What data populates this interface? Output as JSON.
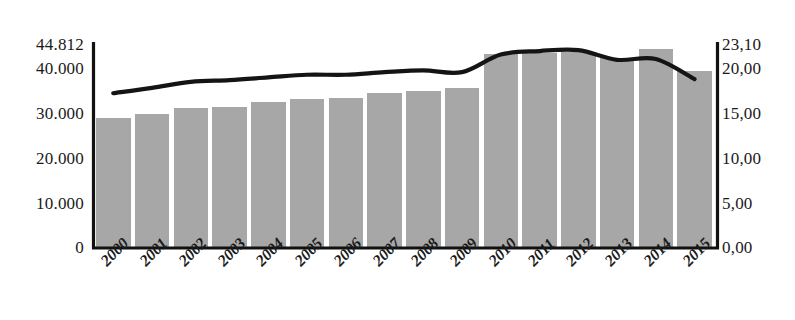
{
  "chart_data": {
    "type": "bar",
    "title": "",
    "subtitle": "",
    "xlabel": "",
    "ylabel": "",
    "grid": false,
    "legend": "none",
    "categories": [
      "2000",
      "2001",
      "2002",
      "2003",
      "2004",
      "2005",
      "2006",
      "2007",
      "2008",
      "2009",
      "2010",
      "2011",
      "2012",
      "2013",
      "2014",
      "2015"
    ],
    "series": [
      {
        "name": "bars",
        "type": "bar",
        "axis": "left",
        "values": [
          28400,
          29300,
          30700,
          30900,
          32000,
          32700,
          32900,
          34000,
          34400,
          35100,
          42700,
          42900,
          43100,
          41800,
          43600,
          38900
        ]
      },
      {
        "name": "line",
        "type": "line",
        "axis": "right",
        "values": [
          17.5,
          18.1,
          18.8,
          19.0,
          19.3,
          19.6,
          19.6,
          19.9,
          20.1,
          19.9,
          21.9,
          22.3,
          22.4,
          21.3,
          21.4,
          19.1
        ]
      }
    ],
    "left_axis": {
      "ticks": [
        "0",
        "10.000",
        "20.000",
        "30.000",
        "40.000",
        "44.812"
      ],
      "tick_values": [
        0,
        10000,
        20000,
        30000,
        40000,
        44812
      ],
      "ylim": [
        0,
        44812
      ]
    },
    "right_axis": {
      "ticks": [
        "0,00",
        "5,00",
        "10,00",
        "15,00",
        "20,00",
        "23,10"
      ],
      "tick_values": [
        0,
        5,
        10,
        15,
        20,
        23.1
      ],
      "ylim": [
        0,
        23.1
      ]
    },
    "colors": {
      "bar_fill": "#a9a9a9",
      "line_stroke": "#141414",
      "axis": "#111111",
      "background": "#ffffff",
      "text": "#1a1a1a"
    }
  }
}
